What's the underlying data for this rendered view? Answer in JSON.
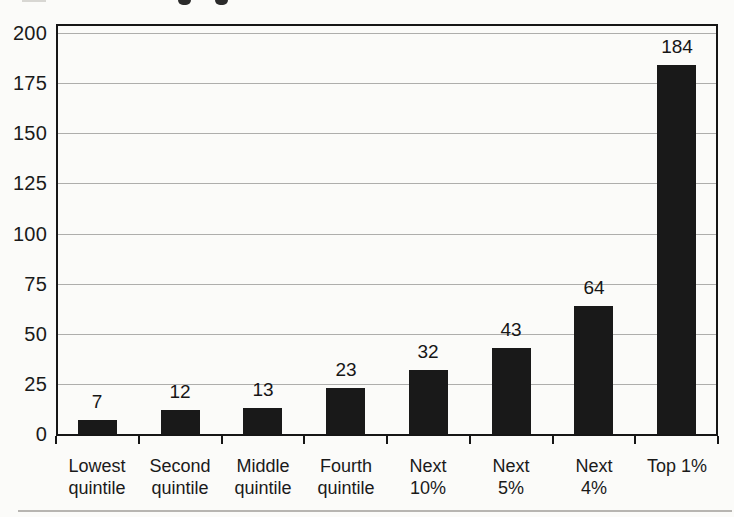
{
  "chart_data": {
    "type": "bar",
    "title": "",
    "xlabel": "",
    "ylabel": "",
    "categories": [
      "Lowest quintile",
      "Second quintile",
      "Middle quintile",
      "Fourth quintile",
      "Next 10%",
      "Next 5%",
      "Next 4%",
      "Top 1%"
    ],
    "category_lines": [
      [
        "Lowest",
        "quintile"
      ],
      [
        "Second",
        "quintile"
      ],
      [
        "Middle",
        "quintile"
      ],
      [
        "Fourth",
        "quintile"
      ],
      [
        "Next",
        "10%"
      ],
      [
        "Next",
        "5%"
      ],
      [
        "Next",
        "4%"
      ],
      [
        "Top 1%"
      ]
    ],
    "values": [
      7,
      12,
      13,
      23,
      32,
      43,
      64,
      184
    ],
    "data_labels": [
      "7",
      "12",
      "13",
      "23",
      "32",
      "43",
      "64",
      "184"
    ],
    "yticks": [
      0,
      25,
      50,
      75,
      100,
      125,
      150,
      175,
      200
    ],
    "ylim": [
      0,
      204
    ],
    "grid": true,
    "legend": false,
    "colors": {
      "bar": "#191919",
      "gridline": "#aeaeac",
      "frame": "#161616",
      "text": "#1a1a1a",
      "page_background": "#fbfbf9"
    }
  }
}
